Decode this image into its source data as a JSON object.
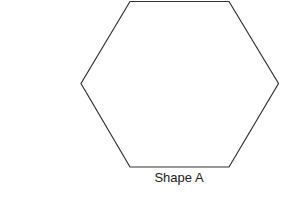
{
  "diagram": {
    "shape": {
      "type": "hexagon",
      "stroke_color": "#333333",
      "fill_color": "#ffffff",
      "label": "Shape A"
    }
  }
}
